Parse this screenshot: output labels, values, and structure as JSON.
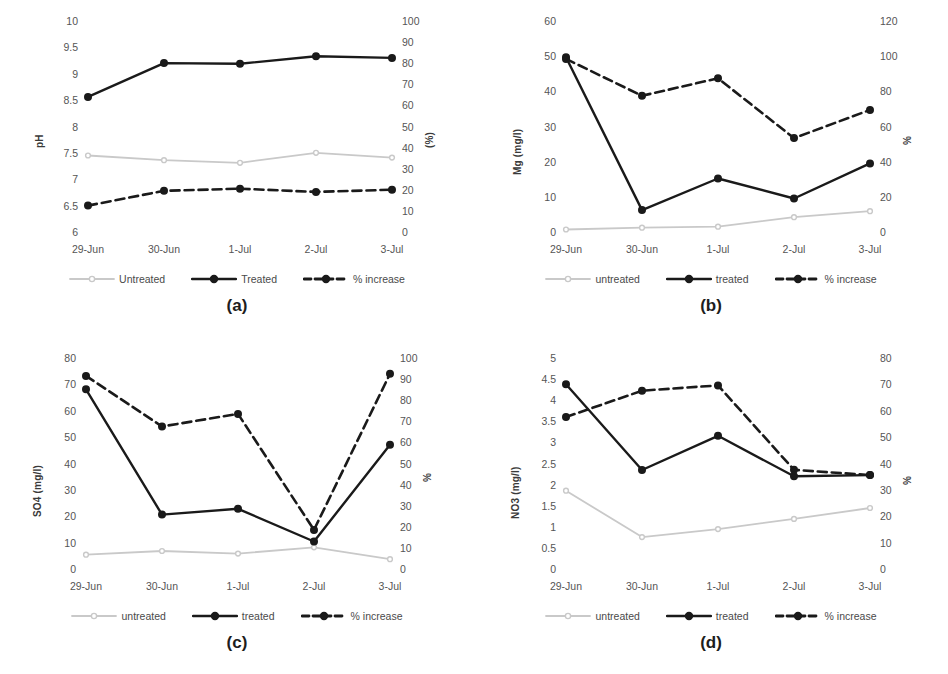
{
  "figure": {
    "background": "#ffffff",
    "panels_order": [
      "a",
      "b",
      "c",
      "d"
    ]
  },
  "colors": {
    "untreated": "#c9c9c9",
    "treated": "#1a1a1a",
    "percent_increase": "#1a1a1a",
    "tick_text": "#555555",
    "axis_title": "#3a3a3a",
    "panel_label": "#1d1d1d"
  },
  "legend": {
    "a": {
      "untreated_label": "Untreated",
      "treated_label": "Treated",
      "percent_label": "% increase"
    },
    "b": {
      "untreated_label": "untreated",
      "treated_label": "treated",
      "percent_label": "% increase"
    },
    "c": {
      "untreated_label": "untreated",
      "treated_label": "treated",
      "percent_label": "% increase"
    },
    "d": {
      "untreated_label": "untreated",
      "treated_label": "treated",
      "percent_label": "% increase"
    }
  },
  "panels": {
    "a": {
      "caption": "(a)"
    },
    "b": {
      "caption": "(b)"
    },
    "c": {
      "caption": "(c)"
    },
    "d": {
      "caption": "(d)"
    }
  },
  "chart_data": [
    {
      "id": "a",
      "type": "line",
      "title": "",
      "caption": "(a)",
      "xlabel": "",
      "ylabel": "pH",
      "y2label": "(%)",
      "categories": [
        "29-Jun",
        "30-Jun",
        "1-Jul",
        "2-Jul",
        "3-Jul"
      ],
      "ylim": [
        6,
        10
      ],
      "yticks": [
        6,
        6.5,
        7,
        7.5,
        8,
        8.5,
        9,
        9.5,
        10
      ],
      "ytick_labels": [
        "6",
        "6.5",
        "7",
        "7.5",
        "8",
        "8.5",
        "9",
        "9.5",
        "10"
      ],
      "y2lim": [
        0,
        100
      ],
      "y2ticks": [
        0,
        10,
        20,
        30,
        40,
        50,
        60,
        70,
        80,
        90,
        100
      ],
      "y2tick_labels": [
        "0",
        "10",
        "20",
        "30",
        "40",
        "50",
        "60",
        "70",
        "80",
        "90",
        "100"
      ],
      "grid": false,
      "legend_position": "bottom",
      "series": [
        {
          "name": "Untreated",
          "axis": "left",
          "style": "solid-light",
          "color": "#c9c9c9",
          "values": [
            7.47,
            7.38,
            7.33,
            7.52,
            7.43
          ]
        },
        {
          "name": "Treated",
          "axis": "left",
          "style": "solid-dark",
          "color": "#1a1a1a",
          "values": [
            8.58,
            9.22,
            9.21,
            9.35,
            9.32
          ]
        },
        {
          "name": "% increase",
          "axis": "right",
          "style": "dashed-dark",
          "color": "#1a1a1a",
          "values": [
            13,
            20,
            21,
            19.5,
            20.5
          ]
        }
      ]
    },
    {
      "id": "b",
      "type": "line",
      "title": "",
      "caption": "(b)",
      "xlabel": "",
      "ylabel": "Mg (mg/l)",
      "y2label": "%",
      "categories": [
        "29-Jun",
        "30-Jun",
        "1-Jul",
        "2-Jul",
        "3-Jul"
      ],
      "ylim": [
        0,
        60
      ],
      "yticks": [
        0,
        10,
        20,
        30,
        40,
        50,
        60
      ],
      "ytick_labels": [
        "0",
        "10",
        "20",
        "30",
        "40",
        "50",
        "60"
      ],
      "y2lim": [
        0,
        120
      ],
      "y2ticks": [
        0,
        20,
        40,
        60,
        80,
        100,
        120
      ],
      "y2tick_labels": [
        "0",
        "20",
        "40",
        "60",
        "80",
        "100",
        "120"
      ],
      "grid": false,
      "legend_position": "bottom",
      "series": [
        {
          "name": "untreated",
          "axis": "left",
          "style": "solid-light",
          "color": "#c9c9c9",
          "values": [
            1.0,
            1.5,
            1.8,
            4.5,
            6.2
          ]
        },
        {
          "name": "treated",
          "axis": "left",
          "style": "solid-dark",
          "color": "#1a1a1a",
          "values": [
            50.0,
            6.5,
            15.5,
            9.8,
            19.8
          ]
        },
        {
          "name": "% increase",
          "axis": "right",
          "style": "dashed-dark",
          "color": "#1a1a1a",
          "values": [
            99,
            78,
            88,
            54,
            70
          ]
        }
      ]
    },
    {
      "id": "c",
      "type": "line",
      "title": "",
      "caption": "(c)",
      "xlabel": "",
      "ylabel": "SO4 (mg/l)",
      "y2label": "%",
      "categories": [
        "29-Jun",
        "30-Jun",
        "1-Jul",
        "2-Jul",
        "3-Jul"
      ],
      "ylim": [
        0,
        80
      ],
      "yticks": [
        0,
        10,
        20,
        30,
        40,
        50,
        60,
        70,
        80
      ],
      "ytick_labels": [
        "0",
        "10",
        "20",
        "30",
        "40",
        "50",
        "60",
        "70",
        "80"
      ],
      "y2lim": [
        0,
        100
      ],
      "y2ticks": [
        0,
        10,
        20,
        30,
        40,
        50,
        60,
        70,
        80,
        90,
        100
      ],
      "y2tick_labels": [
        "0",
        "10",
        "20",
        "30",
        "40",
        "50",
        "60",
        "70",
        "80",
        "90",
        "100"
      ],
      "grid": false,
      "legend_position": "bottom",
      "series": [
        {
          "name": "untreated",
          "axis": "left",
          "style": "solid-light",
          "color": "#c9c9c9",
          "values": [
            5.8,
            7.2,
            6.2,
            8.6,
            4.1
          ]
        },
        {
          "name": "treated",
          "axis": "left",
          "style": "solid-dark",
          "color": "#1a1a1a",
          "values": [
            68.5,
            21.0,
            23.2,
            10.8,
            47.5
          ]
        },
        {
          "name": "% increase",
          "axis": "right",
          "style": "dashed-dark",
          "color": "#1a1a1a",
          "values": [
            92,
            68,
            74,
            19,
            93
          ]
        }
      ]
    },
    {
      "id": "d",
      "type": "line",
      "title": "",
      "caption": "(d)",
      "xlabel": "",
      "ylabel": "NO3 (mg/l)",
      "y2label": "%",
      "categories": [
        "29-Jun",
        "30-Jun",
        "1-Jul",
        "2-Jul",
        "3-Jul"
      ],
      "ylim": [
        0,
        5
      ],
      "yticks": [
        0,
        0.5,
        1,
        1.5,
        2,
        2.5,
        3,
        3.5,
        4,
        4.5,
        5
      ],
      "ytick_labels": [
        "0",
        "0.5",
        "1",
        "1.5",
        "2",
        "2.5",
        "3",
        "3.5",
        "4",
        "4.5",
        "5"
      ],
      "y2lim": [
        0,
        80
      ],
      "y2ticks": [
        0,
        10,
        20,
        30,
        40,
        50,
        60,
        70,
        80
      ],
      "y2tick_labels": [
        "0",
        "10",
        "20",
        "30",
        "40",
        "50",
        "60",
        "70",
        "80"
      ],
      "grid": false,
      "legend_position": "bottom",
      "series": [
        {
          "name": "untreated",
          "axis": "left",
          "style": "solid-light",
          "color": "#c9c9c9",
          "values": [
            1.88,
            0.78,
            0.97,
            1.21,
            1.47
          ]
        },
        {
          "name": "treated",
          "axis": "left",
          "style": "solid-dark",
          "color": "#1a1a1a",
          "values": [
            4.4,
            2.37,
            3.18,
            2.22,
            2.25
          ]
        },
        {
          "name": "% increase",
          "axis": "right",
          "style": "dashed-dark",
          "color": "#1a1a1a",
          "values": [
            58,
            68,
            70,
            38,
            36
          ]
        }
      ]
    }
  ]
}
